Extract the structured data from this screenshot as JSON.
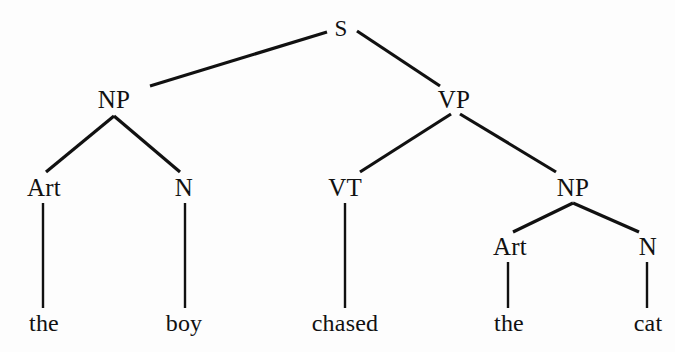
{
  "figure": {
    "kind": "phrase-structure-tree",
    "sentence": "the boy chased the cat",
    "background_color": "#fdfdfd",
    "ink_color": "#111111",
    "width": 675,
    "height": 352
  },
  "nodes": [
    {
      "id": "s",
      "label": "S",
      "x": 341,
      "y": 28,
      "level": "root"
    },
    {
      "id": "np1",
      "label": "NP",
      "x": 114,
      "y": 99,
      "level": "phrase"
    },
    {
      "id": "vp",
      "label": "VP",
      "x": 454,
      "y": 99,
      "level": "phrase"
    },
    {
      "id": "art1",
      "label": "Art",
      "x": 44,
      "y": 187,
      "level": "pos"
    },
    {
      "id": "n1",
      "label": "N",
      "x": 184,
      "y": 187,
      "level": "pos"
    },
    {
      "id": "vt",
      "label": "VT",
      "x": 345,
      "y": 187,
      "level": "pos"
    },
    {
      "id": "np2",
      "label": "NP",
      "x": 573,
      "y": 187,
      "level": "phrase"
    },
    {
      "id": "art2",
      "label": "Art",
      "x": 510,
      "y": 246,
      "level": "pos"
    },
    {
      "id": "n2",
      "label": "N",
      "x": 648,
      "y": 246,
      "level": "pos"
    },
    {
      "id": "word_the1",
      "label": "the",
      "x": 44,
      "y": 323,
      "level": "word"
    },
    {
      "id": "word_boy",
      "label": "boy",
      "x": 184,
      "y": 323,
      "level": "word"
    },
    {
      "id": "word_chased",
      "label": "chased",
      "x": 345,
      "y": 323,
      "level": "word"
    },
    {
      "id": "word_the2",
      "label": "the",
      "x": 509,
      "y": 323,
      "level": "word"
    },
    {
      "id": "word_cat",
      "label": "cat",
      "x": 648,
      "y": 323,
      "level": "word"
    }
  ],
  "edges": [
    {
      "id": "edge-s-np1",
      "from": "S",
      "to": "NP",
      "x1": 327,
      "y1": 32,
      "x2": 150,
      "y2": 86
    },
    {
      "id": "edge-s-vp",
      "from": "S",
      "to": "VP",
      "x1": 357,
      "y1": 31,
      "x2": 440,
      "y2": 86
    },
    {
      "id": "edge-np1-art1",
      "from": "NP",
      "to": "Art",
      "x1": 114,
      "y1": 116,
      "x2": 46,
      "y2": 172
    },
    {
      "id": "edge-np1-n1",
      "from": "NP",
      "to": "N",
      "x1": 114,
      "y1": 116,
      "x2": 180,
      "y2": 172
    },
    {
      "id": "edge-vp-vt",
      "from": "VP",
      "to": "VT",
      "x1": 451,
      "y1": 114,
      "x2": 360,
      "y2": 172
    },
    {
      "id": "edge-vp-np2",
      "from": "VP",
      "to": "NP",
      "x1": 460,
      "y1": 114,
      "x2": 556,
      "y2": 172
    },
    {
      "id": "edge-np2-art2",
      "from": "NP",
      "to": "Art",
      "x1": 573,
      "y1": 203,
      "x2": 513,
      "y2": 232
    },
    {
      "id": "edge-np2-n2",
      "from": "NP",
      "to": "N",
      "x1": 573,
      "y1": 203,
      "x2": 639,
      "y2": 232
    },
    {
      "id": "edge-art1-the1",
      "from": "Art",
      "to": "the",
      "x1": 43,
      "y1": 203,
      "x2": 43,
      "y2": 308
    },
    {
      "id": "edge-n1-boy",
      "from": "N",
      "to": "boy",
      "x1": 185,
      "y1": 203,
      "x2": 185,
      "y2": 308
    },
    {
      "id": "edge-vt-chased",
      "from": "VT",
      "to": "chased",
      "x1": 345,
      "y1": 203,
      "x2": 345,
      "y2": 308
    },
    {
      "id": "edge-art2-the2",
      "from": "Art",
      "to": "the",
      "x1": 508,
      "y1": 262,
      "x2": 508,
      "y2": 308
    },
    {
      "id": "edge-n2-cat",
      "from": "N",
      "to": "cat",
      "x1": 647,
      "y1": 262,
      "x2": 647,
      "y2": 308
    }
  ]
}
